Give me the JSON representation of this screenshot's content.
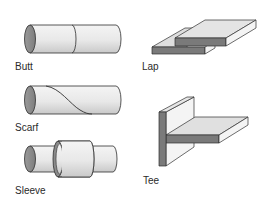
{
  "diagram": {
    "type": "joint-types",
    "background": "#ffffff",
    "colors": {
      "end_face": "#8c8c8c",
      "surface_light": "#ececec",
      "surface_top": "#dcdcdc",
      "cut_face": "#7a7a7a",
      "outline": "#2f2f2f"
    },
    "joints": [
      {
        "id": "butt",
        "label": "Butt",
        "shape": "cylinder-split"
      },
      {
        "id": "lap",
        "label": "Lap",
        "shape": "overlapping-plates"
      },
      {
        "id": "scarf",
        "label": "Scarf",
        "shape": "cylinder-diagonal"
      },
      {
        "id": "tee",
        "label": "Tee",
        "shape": "t-plates"
      },
      {
        "id": "sleeve",
        "label": "Sleeve",
        "shape": "cylinder-sleeve"
      }
    ]
  }
}
